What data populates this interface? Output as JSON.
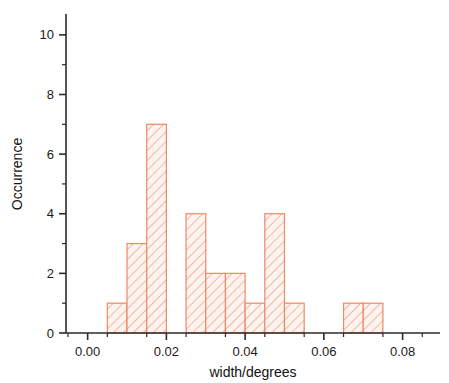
{
  "chart_data": {
    "type": "bar",
    "title": "",
    "subtitle": "",
    "xlabel": "width/degrees",
    "ylabel": "Occurrence",
    "xlim": [
      -0.0055,
      0.0895
    ],
    "ylim": [
      0,
      10.7
    ],
    "x_ticks": [
      0.0,
      0.02,
      0.04,
      0.06,
      0.08
    ],
    "x_tick_labels": [
      "0.00",
      "0.02",
      "0.04",
      "0.06",
      "0.08"
    ],
    "x_minor_ticks": [
      -0.005,
      0.005,
      0.015,
      0.025,
      0.035,
      0.045,
      0.055,
      0.065,
      0.075,
      0.085
    ],
    "y_ticks": [
      0,
      2,
      4,
      6,
      8,
      10
    ],
    "y_tick_labels": [
      "0",
      "2",
      "4",
      "6",
      "8",
      "10"
    ],
    "y_minor_ticks": [
      1,
      3,
      5,
      7,
      9
    ],
    "grid": false,
    "legend": null,
    "bin_width": 0.005,
    "bin_edges": [
      0.005,
      0.01,
      0.015,
      0.02,
      0.025,
      0.03,
      0.035,
      0.04,
      0.045,
      0.05,
      0.055,
      0.065,
      0.07,
      0.075
    ],
    "bins": [
      {
        "x0": 0.005,
        "x1": 0.01,
        "value": 1
      },
      {
        "x0": 0.01,
        "x1": 0.015,
        "value": 3
      },
      {
        "x0": 0.015,
        "x1": 0.02,
        "value": 7
      },
      {
        "x0": 0.025,
        "x1": 0.03,
        "value": 4
      },
      {
        "x0": 0.03,
        "x1": 0.035,
        "value": 2
      },
      {
        "x0": 0.035,
        "x1": 0.04,
        "value": 2
      },
      {
        "x0": 0.04,
        "x1": 0.045,
        "value": 1
      },
      {
        "x0": 0.045,
        "x1": 0.05,
        "value": 4
      },
      {
        "x0": 0.05,
        "x1": 0.055,
        "value": 1
      },
      {
        "x0": 0.065,
        "x1": 0.07,
        "value": 1
      },
      {
        "x0": 0.07,
        "x1": 0.075,
        "value": 1
      }
    ],
    "categories": [
      "0.005",
      "0.010",
      "0.015",
      "0.025",
      "0.030",
      "0.035",
      "0.040",
      "0.045",
      "0.050",
      "0.065",
      "0.070"
    ],
    "values": [
      1,
      3,
      7,
      4,
      2,
      2,
      1,
      4,
      1,
      1,
      1
    ],
    "colors": {
      "bar_stroke": "#ee8866",
      "bar_fill": "#fbeee9",
      "hatch": "#f2a185",
      "axis": "#2b2b2b",
      "text": "#1a1a1a",
      "background": "#ffffff"
    }
  }
}
